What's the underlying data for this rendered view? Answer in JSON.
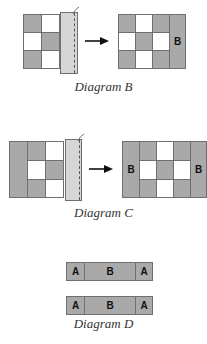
{
  "diagrams": [
    {
      "id": "B",
      "caption": "Diagram B",
      "before_grid": [
        [
          "gray",
          "white",
          "gray"
        ],
        [
          "white",
          "gray",
          "white"
        ],
        [
          "gray",
          "white",
          "gray"
        ]
      ],
      "after_grid": [
        [
          "gray",
          "white",
          "gray",
          "B-strip"
        ],
        [
          "white",
          "gray",
          "white",
          "B-strip"
        ],
        [
          "gray",
          "white",
          "gray",
          "B-strip"
        ]
      ],
      "after_label": "B"
    },
    {
      "id": "C",
      "caption": "Diagram C",
      "after_labels": [
        "B",
        "B"
      ]
    },
    {
      "id": "D",
      "caption": "Diagram D",
      "strips": [
        {
          "cells": [
            "A",
            "B",
            "A"
          ]
        },
        {
          "cells": [
            "A",
            "B",
            "A"
          ]
        }
      ]
    }
  ],
  "colors": {
    "gray": "#a9a9a9",
    "white": "#ffffff",
    "border": "#6f6f6f",
    "fold": "#d6d6d6"
  },
  "arrow_icon": "right-arrow"
}
